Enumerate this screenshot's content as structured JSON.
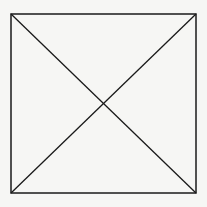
{
  "diagram": {
    "shape": "square-with-diagonals",
    "stroke_color": "#1a1a1a",
    "background_color": "#f6f6f4",
    "square": {
      "x1": 11,
      "y1": 14,
      "x2": 196,
      "y2": 193
    },
    "diagonals": [
      {
        "from": [
          11,
          14
        ],
        "to": [
          196,
          193
        ]
      },
      {
        "from": [
          196,
          14
        ],
        "to": [
          11,
          193
        ]
      }
    ]
  }
}
